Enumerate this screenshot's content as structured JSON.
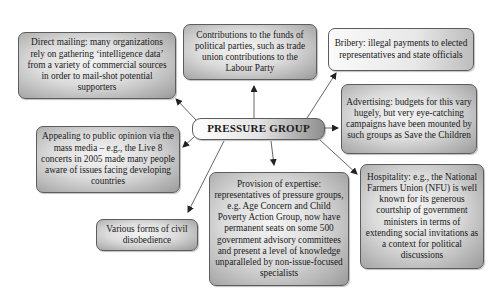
{
  "diagram": {
    "center": {
      "label": "PRESSURE GROUP"
    },
    "nodes": [
      {
        "id": "direct-mailing",
        "text": "Direct mailing: many organizations rely on gathering ‘intelligence data’ from a variety of commercial sources in order to mail-shot potential supporters"
      },
      {
        "id": "contributions",
        "text": "Contributions to the funds of political parties, such as trade union contributions to the Labour Party"
      },
      {
        "id": "bribery",
        "text": "Bribery: illegal payments to elected representatives and state officials"
      },
      {
        "id": "advertising",
        "text": "Advertising: budgets for this vary hugely, but very eye-catching campaigns have been mounted by such groups as Save the Children"
      },
      {
        "id": "public-opinion",
        "text": "Appealing to public opinion via the mass media – e.g., the Live 8 concerts in 2005 made many people aware of issues facing developing countries"
      },
      {
        "id": "hospitality",
        "text": "Hospitality: e.g., the National Farmers Union (NFU) is well known for its generous courtship of government ministers in terms of extending social invitations as a context for political discussions"
      },
      {
        "id": "expertise",
        "text": "Provision of expertise: representatives of pressure groups, e.g. Age Concern and Child Poverty Action Group, now have permanent seats on some 500 government advisory committees and present a level of knowledge unparalleled by non-issue-focused specialists"
      },
      {
        "id": "civil-disobedience",
        "text": "Various forms of civil disobedience"
      }
    ],
    "colors": {
      "border": "#5c5c5c",
      "arrow": "#333333",
      "fill_light": "#f4f4f4",
      "fill_dark": "#9a9a9a"
    }
  }
}
